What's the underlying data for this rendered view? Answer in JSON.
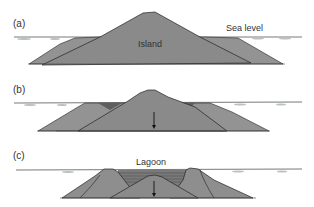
{
  "panels": [
    {
      "label": "(a)",
      "title": "Island",
      "annotation": "Sea level"
    },
    {
      "label": "(b)"
    },
    {
      "label": "(c)",
      "annotation": "Lagoon"
    }
  ],
  "colors": {
    "rock": "#8e8e8e",
    "rock_dark": "#6e6e6e",
    "reef": "#999999",
    "outline": "#222222",
    "sea": "#bfc6c8",
    "lagoon_water": "#7c7c7c"
  }
}
